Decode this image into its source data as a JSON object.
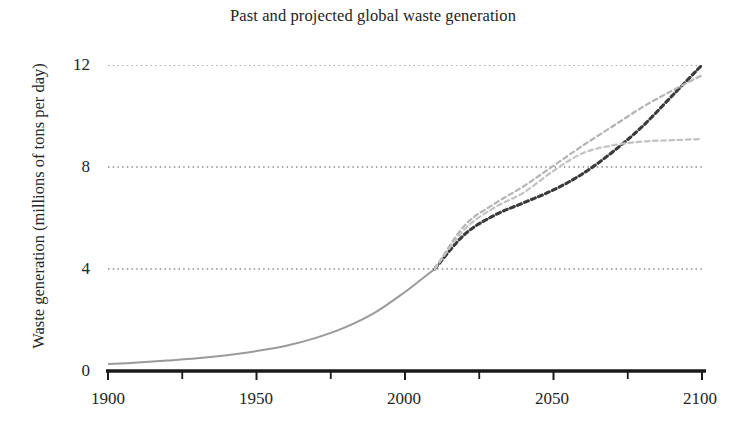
{
  "chart_data": {
    "type": "line",
    "title": "Past and projected global waste generation",
    "xlabel": "",
    "ylabel": "Waste generation (millions of tons per day)",
    "xlim": [
      1900,
      2100
    ],
    "ylim": [
      0,
      12
    ],
    "xticks": [
      1900,
      1950,
      2000,
      2050,
      2100
    ],
    "xtick_labels": [
      "1900",
      "1950",
      "2000",
      "2050",
      "2100"
    ],
    "xticks_minor": [
      1925,
      1975,
      2025,
      2075
    ],
    "yticks": [
      0,
      4,
      8,
      12
    ],
    "ytick_labels": [
      "0",
      "4",
      "8",
      "12"
    ],
    "grid": "horizontal-dotted",
    "legend": "none",
    "colors": {
      "historical": "#9a9a9a",
      "projection_high": "#3a3a3a",
      "projection_mid": "#b4b4b4",
      "projection_low": "#c2c2c2",
      "gridline": "#555555",
      "axis": "#1a1a1a"
    },
    "series": [
      {
        "name": "Historical waste generation",
        "style": "solid",
        "color": "#9a9a9a",
        "x": [
          1900,
          1910,
          1920,
          1930,
          1940,
          1950,
          1960,
          1970,
          1980,
          1990,
          2000,
          2005,
          2010
        ],
        "values": [
          0.27,
          0.33,
          0.41,
          0.5,
          0.62,
          0.78,
          0.99,
          1.3,
          1.72,
          2.3,
          3.1,
          3.55,
          4.0
        ]
      },
      {
        "name": "Projection - high growth",
        "style": "dashed",
        "color": "#3a3a3a",
        "x": [
          2010,
          2020,
          2030,
          2040,
          2050,
          2060,
          2070,
          2080,
          2090,
          2100
        ],
        "values": [
          4.0,
          5.35,
          6.1,
          6.6,
          7.1,
          7.75,
          8.6,
          9.6,
          10.8,
          12.0
        ]
      },
      {
        "name": "Projection - medium growth",
        "style": "dashed",
        "color": "#b4b4b4",
        "x": [
          2010,
          2020,
          2030,
          2040,
          2050,
          2060,
          2070,
          2080,
          2090,
          2100
        ],
        "values": [
          4.0,
          5.7,
          6.55,
          7.25,
          8.05,
          8.85,
          9.6,
          10.35,
          11.0,
          11.6
        ]
      },
      {
        "name": "Projection - low growth (plateau)",
        "style": "dashed",
        "color": "#c2c2c2",
        "x": [
          2010,
          2020,
          2030,
          2040,
          2050,
          2060,
          2070,
          2080,
          2090,
          2100
        ],
        "values": [
          4.0,
          5.55,
          6.4,
          7.0,
          7.85,
          8.55,
          8.85,
          9.0,
          9.05,
          9.1
        ]
      }
    ]
  }
}
